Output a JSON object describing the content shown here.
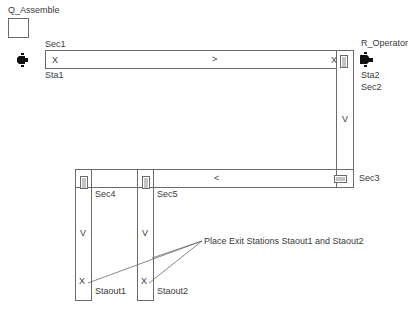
{
  "resources": {
    "queue": {
      "label": "Q_Assemble"
    },
    "operator": {
      "label": "R_Operator"
    }
  },
  "sections": {
    "sec1": "Sec1",
    "sec2": "Sec2",
    "sec3": "Sec3",
    "sec4": "Sec4",
    "sec5": "Sec5"
  },
  "stations": {
    "sta1": "Sta1",
    "sta2": "Sta2",
    "staout1": "Staout1",
    "staout2": "Staout2"
  },
  "markers": {
    "sta1_x": "X",
    "sta2_x": "X",
    "staout1_x": "X",
    "staout2_x": "X",
    "top_dir": ">",
    "bottom_dir": "<",
    "right_dir": "V",
    "col1_dir": "V",
    "col2_dir": "V"
  },
  "annotation": {
    "text": "Place Exit Stations Staout1 and Staout2"
  },
  "colors": {
    "line": "#6a6a6a",
    "text": "#3a3a3a"
  }
}
